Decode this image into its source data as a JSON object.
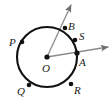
{
  "figure": {
    "type": "geometry-diagram",
    "canvas": {
      "width": 112,
      "height": 105
    },
    "colors": {
      "background": "#ffffff",
      "circle_stroke": "#111111",
      "ray_stroke": "#8c8c8c",
      "point_fill": "#111111",
      "label_text": "#1a1a1a"
    },
    "circle": {
      "center_label": "O",
      "center": {
        "x": 47,
        "y": 57
      },
      "radius": 30,
      "stroke_width": 2.1
    },
    "center_point": {
      "label": "O",
      "label_pos": {
        "x": 42,
        "y": 63
      },
      "x": 47,
      "y": 57,
      "dot_radius": 2.6
    },
    "points": [
      {
        "label": "B",
        "x": 65,
        "y": 28,
        "label_x": 68,
        "label_y": 21,
        "dot_radius": 2.3
      },
      {
        "label": "S",
        "x": 75,
        "y": 40,
        "label_x": 79,
        "label_y": 31,
        "dot_radius": 2.3
      },
      {
        "label": "A",
        "x": 77,
        "y": 53,
        "label_x": 79,
        "label_y": 57,
        "dot_radius": 2.6
      },
      {
        "label": "R",
        "x": 71,
        "y": 84,
        "label_x": 74,
        "label_y": 85,
        "dot_radius": 2.3
      },
      {
        "label": "Q",
        "x": 29,
        "y": 85,
        "label_x": 17,
        "label_y": 86,
        "dot_radius": 2.3
      },
      {
        "label": "P",
        "x": 22,
        "y": 42,
        "label_x": 9,
        "label_y": 37,
        "dot_radius": 2.3
      }
    ],
    "rays": [
      {
        "name": "ray-OB",
        "from_label": "O",
        "through_label": "B",
        "x1": 47,
        "y1": 57,
        "x2": 71,
        "y2": 5,
        "stroke_width": 1.3,
        "arrowhead": true
      },
      {
        "name": "ray-OA",
        "from_label": "O",
        "through_label": "A",
        "x1": 47,
        "y1": 57,
        "x2": 108,
        "y2": 47,
        "stroke_width": 1.3,
        "arrowhead": true
      }
    ]
  }
}
